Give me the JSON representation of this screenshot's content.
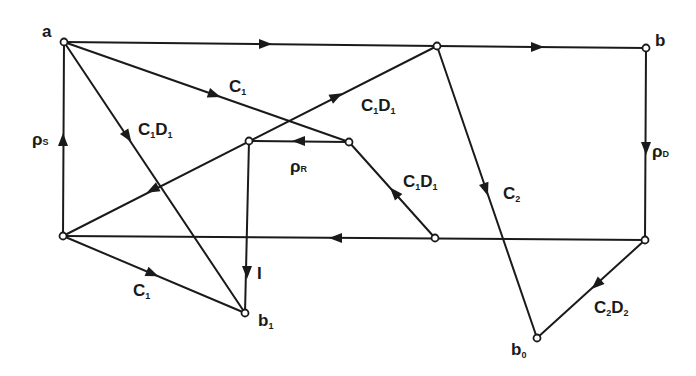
{
  "diagram": {
    "type": "directed-graph",
    "colors": {
      "stroke": "#1a1a1a",
      "background": "#ffffff"
    },
    "nodes": [
      {
        "id": "a",
        "x": 64,
        "y": 42,
        "label": "a"
      },
      {
        "id": "top_mid",
        "x": 437,
        "y": 46,
        "label": ""
      },
      {
        "id": "b",
        "x": 646,
        "y": 48,
        "label": "b"
      },
      {
        "id": "i_top",
        "x": 249,
        "y": 141,
        "label": ""
      },
      {
        "id": "r",
        "x": 349,
        "y": 142,
        "label": ""
      },
      {
        "id": "left_bot",
        "x": 63,
        "y": 236,
        "label": ""
      },
      {
        "id": "mid_bot",
        "x": 435,
        "y": 238,
        "label": ""
      },
      {
        "id": "right_bot",
        "x": 645,
        "y": 240,
        "label": ""
      },
      {
        "id": "b1",
        "x": 245,
        "y": 313,
        "label": "b",
        "sub": "1"
      },
      {
        "id": "b0",
        "x": 537,
        "y": 338,
        "label": "b",
        "sub": "0"
      }
    ],
    "labels": {
      "a": "a",
      "b": "b",
      "b1_main": "b",
      "b1_sub": "1",
      "b0_main": "b",
      "b0_sub": "0",
      "rho_s_main": "ρ",
      "rho_s_sub": "S",
      "rho_d_main": "ρ",
      "rho_d_sub": "D",
      "rho_r_main": "ρ",
      "rho_r_sub": "R",
      "c1_top_C": "C",
      "c1_top_sub": "1",
      "c1d1_left_C": "C",
      "c1d1_left_Csub": "1",
      "c1d1_left_D": "D",
      "c1d1_left_Dsub": "1",
      "c1d1_upper_C": "C",
      "c1d1_upper_Csub": "1",
      "c1d1_upper_D": "D",
      "c1d1_upper_Dsub": "1",
      "c1d1_right_C": "C",
      "c1d1_right_Csub": "1",
      "c1d1_right_D": "D",
      "c1d1_right_Dsub": "1",
      "c2_C": "C",
      "c2_sub": "2",
      "c2d2_C": "C",
      "c2d2_Csub": "2",
      "c2d2_D": "D",
      "c2d2_Dsub": "2",
      "c1_bot_C": "C",
      "c1_bot_sub": "1",
      "i_label": "I"
    },
    "edges": [
      {
        "from": "a",
        "to": "top_mid",
        "label": ""
      },
      {
        "from": "top_mid",
        "to": "b",
        "label": ""
      },
      {
        "from": "b",
        "to": "right_bot",
        "label": "ρD"
      },
      {
        "from": "left_bot",
        "to": "a",
        "label": "ρS"
      },
      {
        "from": "a",
        "to": "r",
        "label": "C1"
      },
      {
        "from": "a",
        "to": "b1",
        "label": "C1D1"
      },
      {
        "from": "i_top",
        "to": "top_mid",
        "label": "C1D1"
      },
      {
        "from": "i_top",
        "to": "left_bot",
        "label": ""
      },
      {
        "from": "r",
        "to": "i_top",
        "label": "ρR"
      },
      {
        "from": "mid_bot",
        "to": "r",
        "label": "C1D1"
      },
      {
        "from": "top_mid",
        "to": "b0",
        "label": "C2"
      },
      {
        "from": "right_bot",
        "to": "mid_bot",
        "label": ""
      },
      {
        "from": "mid_bot",
        "to": "left_bot",
        "label": ""
      },
      {
        "from": "i_top",
        "to": "b1",
        "label": "I"
      },
      {
        "from": "left_bot",
        "to": "b1",
        "label": "C1"
      },
      {
        "from": "right_bot",
        "to": "b0",
        "label": "C2D2"
      }
    ]
  }
}
